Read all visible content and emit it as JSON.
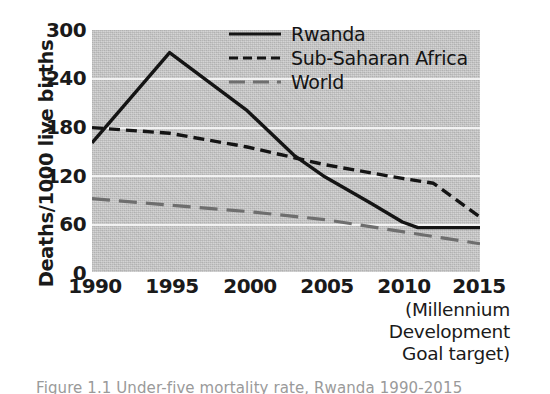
{
  "chart_data": {
    "type": "line",
    "title": "",
    "xlabel": "",
    "ylabel": "Deaths/1000 live births",
    "xlim": [
      1990,
      2015
    ],
    "ylim": [
      0,
      300
    ],
    "grid": true,
    "gridlines_y": [
      60,
      120,
      180,
      240
    ],
    "legend_position": "top-right-inside",
    "x_ticks": [
      "1990",
      "1995",
      "2000",
      "2005",
      "2010",
      "2015"
    ],
    "x_tick_values": [
      1990,
      1995,
      2000,
      2005,
      2010,
      2015
    ],
    "y_ticks": [
      "0",
      "60",
      "120",
      "180",
      "240",
      "300"
    ],
    "y_tick_values": [
      0,
      60,
      120,
      180,
      240,
      300
    ],
    "axis_note": [
      "(Millennium",
      "Development",
      "Goal target)"
    ],
    "series": [
      {
        "name": "Rwanda",
        "style": "solid",
        "color": "#141414",
        "x": [
          1990,
          1995,
          2000,
          2003,
          2005,
          2008,
          2010,
          2011,
          2013,
          2015
        ],
        "values": [
          160,
          272,
          200,
          145,
          118,
          85,
          62,
          55,
          55,
          55
        ]
      },
      {
        "name": "Sub-Saharan Africa",
        "style": "dashed",
        "color": "#141414",
        "x": [
          1990,
          1995,
          2000,
          2005,
          2010,
          2012,
          2015
        ],
        "values": [
          179,
          172,
          155,
          133,
          116,
          110,
          68
        ]
      },
      {
        "name": "World",
        "style": "long-dashed",
        "color": "#6e6e6e",
        "x": [
          1990,
          1995,
          2000,
          2005,
          2010,
          2015
        ],
        "values": [
          91,
          83,
          75,
          65,
          50,
          35
        ]
      }
    ]
  },
  "legend": {
    "items": [
      {
        "label": "Rwanda",
        "swatch": "solid-line-swatch"
      },
      {
        "label": "Sub-Saharan Africa",
        "swatch": "dashed-line-swatch"
      },
      {
        "label": "World",
        "swatch": "long-dashed-line-swatch"
      }
    ]
  },
  "colors": {
    "plot_background": "#c9c9c9",
    "gridline": "#f2f2f2",
    "rwanda": "#141414",
    "sub_saharan_africa": "#141414",
    "world": "#6e6e6e",
    "text": "#141414"
  },
  "bottom_caption": "Figure 1.1 Under-five mortality rate, Rwanda 1990-2015"
}
